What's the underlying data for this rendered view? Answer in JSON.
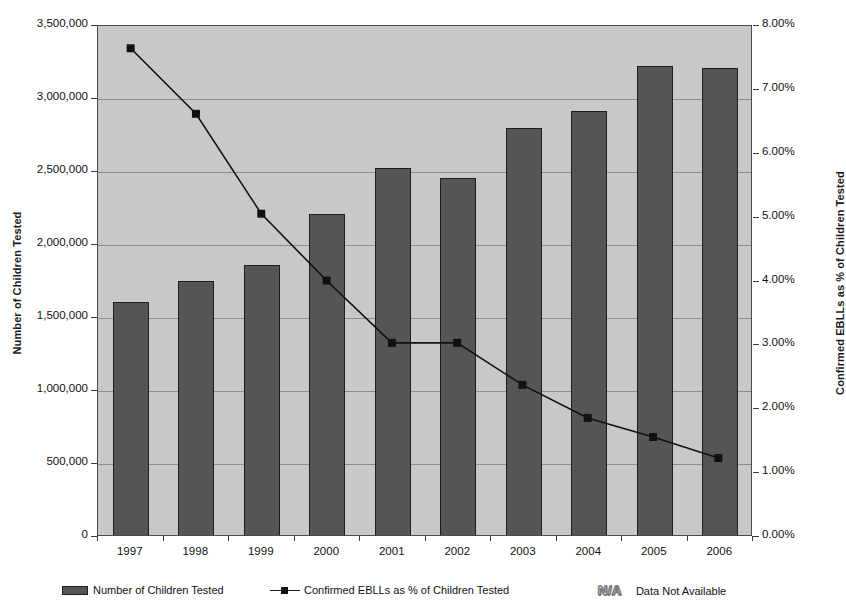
{
  "chart_data": {
    "type": "bar",
    "title": "",
    "subtitle": "",
    "xlabel": "",
    "ylabel": "Number of Children Tested",
    "y2label": "Confirmed EBLLs as % of Children Tested",
    "categories": [
      "1997",
      "1998",
      "1999",
      "2000",
      "2001",
      "2002",
      "2003",
      "2004",
      "2005",
      "2006"
    ],
    "ylim": [
      0,
      3500000
    ],
    "y2lim": [
      0,
      0.08
    ],
    "grid": true,
    "legend_position": "bottom",
    "y_ticks": [
      "0",
      "500,000",
      "1,000,000",
      "1,500,000",
      "2,000,000",
      "2,500,000",
      "3,000,000",
      "3,500,000"
    ],
    "y_tick_values": [
      0,
      500000,
      1000000,
      1500000,
      2000000,
      2500000,
      3000000,
      3500000
    ],
    "y2_ticks": [
      "0.00%",
      "1.00%",
      "2.00%",
      "3.00%",
      "4.00%",
      "5.00%",
      "6.00%",
      "7.00%",
      "8.00%"
    ],
    "y2_tick_values": [
      0,
      1,
      2,
      3,
      4,
      5,
      6,
      7,
      8
    ],
    "series": [
      {
        "name": "Number of Children Tested",
        "type": "bar",
        "axis": "left",
        "color": "#555555",
        "values": [
          1610000,
          1755000,
          1865000,
          2215000,
          2530000,
          2460000,
          2800000,
          2920000,
          3225000,
          3215000
        ]
      },
      {
        "name": "Confirmed EBLLs as % of Children Tested",
        "type": "line",
        "axis": "right",
        "color": "#111111",
        "values": [
          7.65,
          6.62,
          5.05,
          4.0,
          3.02,
          3.02,
          2.36,
          1.84,
          1.54,
          1.21
        ]
      }
    ]
  },
  "axes": {
    "left_title": "Number of Children Tested",
    "right_title": "Confirmed EBLLs as % of Children Tested"
  },
  "legend": {
    "items": [
      {
        "label": "Number of Children Tested",
        "marker": "bar-swatch"
      },
      {
        "label": "Confirmed EBLLs as % of Children Tested",
        "marker": "line-marker"
      }
    ],
    "na_abbr": "N/A",
    "na_label": "Data Not Available"
  },
  "colors": {
    "plot_background": "#c8c8c8",
    "bar_fill": "#555555",
    "bar_border": "#1d1d1d",
    "line": "#111111",
    "gridline": "#8d8d8d",
    "axis": "#3a3a3a",
    "text": "#111111"
  }
}
